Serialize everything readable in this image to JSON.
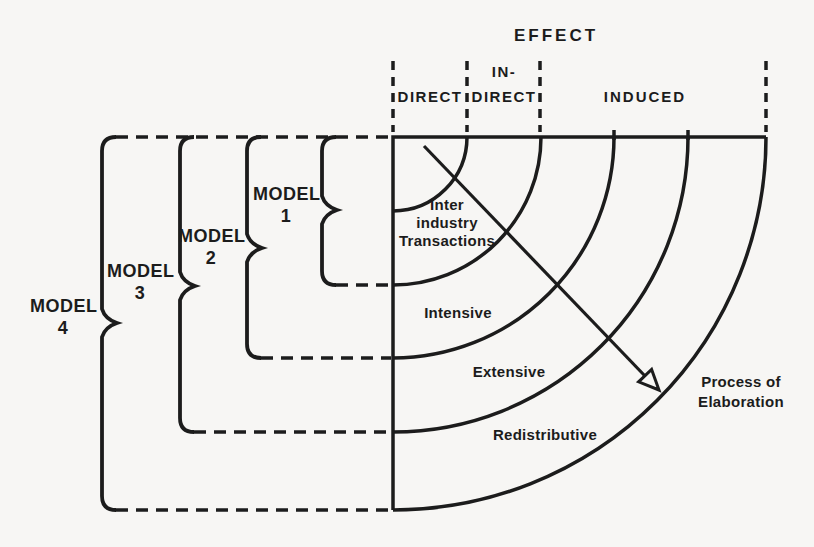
{
  "colors": {
    "background": "#f7f6f4",
    "ink": "#1c1c1c"
  },
  "header": {
    "title": "EFFECT",
    "direct": "DIRECT",
    "indirect_line1": "IN-",
    "indirect_line2": "DIRECT",
    "induced": "INDUCED"
  },
  "models": [
    {
      "word": "MODEL",
      "number": "1"
    },
    {
      "word": "MODEL",
      "number": "2"
    },
    {
      "word": "MODEL",
      "number": "3"
    },
    {
      "word": "MODEL",
      "number": "4"
    }
  ],
  "rings": [
    {
      "lines": [
        "Inter",
        "industry",
        "Transactions"
      ]
    },
    {
      "label": "Intensive"
    },
    {
      "label": "Extensive"
    },
    {
      "label": "Redistributive"
    }
  ],
  "arrow": {
    "line1": "Process of",
    "line2": "Elaboration"
  }
}
